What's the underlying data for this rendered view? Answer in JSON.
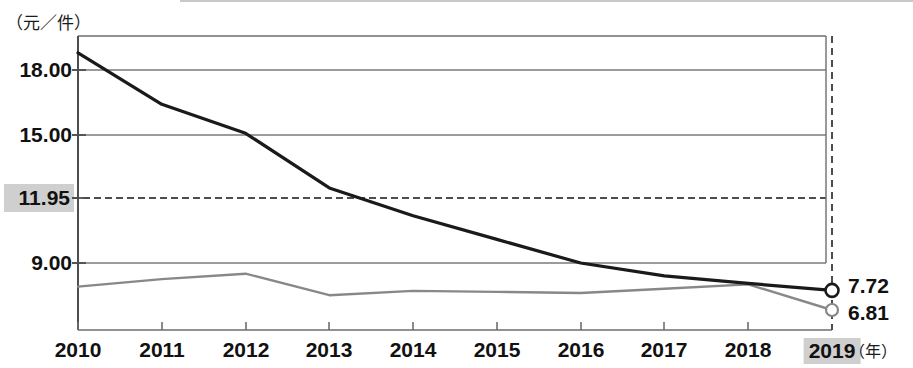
{
  "axis": {
    "y_unit_caption": "（元／件）",
    "x_unit_caption": "（年）"
  },
  "labels": {
    "y_18": "18.00",
    "y_15": "15.00",
    "y_1195": "11.95",
    "y_9": "9.00",
    "x_2010": "2010",
    "x_2011": "2011",
    "x_2012": "2012",
    "x_2013": "2013",
    "x_2014": "2014",
    "x_2015": "2015",
    "x_2016": "2016",
    "x_2017": "2017",
    "x_2018": "2018",
    "x_2019": "2019",
    "end_upper": "7.72",
    "end_lower": "6.81"
  },
  "colors": {
    "series_upper": "#1a1a1a",
    "series_lower": "#888888",
    "gridline": "#7a7a7a",
    "reference_line": "#4d4d4d",
    "highlight_background": "#cfcfcf",
    "plot_border": "#6e6e6e"
  },
  "chart_data": {
    "type": "line",
    "title": "",
    "subtitle": "",
    "xlabel": "（年）",
    "ylabel": "（元／件）",
    "x": [
      2010,
      2011,
      2012,
      2013,
      2014,
      2015,
      2016,
      2017,
      2018,
      2019
    ],
    "categories": [
      "2010",
      "2011",
      "2012",
      "2013",
      "2014",
      "2015",
      "2016",
      "2017",
      "2018",
      "2019"
    ],
    "series": [
      {
        "name": "upper-series",
        "color": "#1a1a1a",
        "values": [
          18.8,
          16.4,
          15.05,
          12.5,
          11.2,
          10.1,
          9.0,
          8.4,
          8.05,
          7.72
        ],
        "end_label": "7.72",
        "end_marker": "open-circle"
      },
      {
        "name": "lower-series",
        "color": "#888888",
        "values": [
          7.9,
          8.25,
          8.5,
          7.5,
          7.7,
          7.65,
          7.6,
          7.8,
          8.0,
          6.81
        ],
        "end_label": "6.81",
        "end_marker": "open-circle"
      }
    ],
    "ytick_labels": [
      "18.00",
      "15.00",
      "11.95",
      "9.00"
    ],
    "ytick_values": [
      18.0,
      15.0,
      11.95,
      9.0
    ],
    "ylim": [
      5.9,
      19.55
    ],
    "xlim": [
      2010,
      2019
    ],
    "grid": true,
    "gridlines": [
      18.0,
      15.0,
      11.95,
      9.0
    ],
    "reference_line": {
      "value": 11.95,
      "style": "dashed",
      "label": "11.95",
      "highlighted": true
    },
    "vertical_reference_line": {
      "x": 2019,
      "style": "dashed",
      "highlighted": true
    },
    "legend": null,
    "legend_position": "none",
    "annotations": [
      {
        "text": "7.72",
        "x": 2019,
        "y": 7.72
      },
      {
        "text": "6.81",
        "x": 2019,
        "y": 6.81
      }
    ]
  }
}
